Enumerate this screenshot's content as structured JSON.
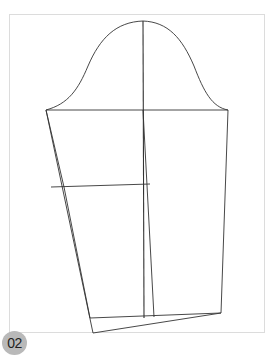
{
  "figure": {
    "badge_label": "02",
    "stroke_color": "#333333",
    "frame_color": "#dcdcdc",
    "badge_color": "#b9b9b9"
  }
}
